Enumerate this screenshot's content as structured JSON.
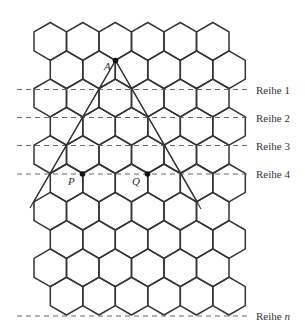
{
  "figure": {
    "grid": {
      "rows": 10,
      "hexes_per_row": 6,
      "orientation": "pointy-top",
      "origin_x": 34,
      "origin_top_y": 22.5,
      "hex_width": 32.5,
      "row_step": 28.3,
      "side": 18.9,
      "stroke": "#333333",
      "stroke_width": 1.5
    },
    "row_lines": [
      {
        "label": "Reihe ",
        "index": "1",
        "italic_index": false,
        "y": 89.5
      },
      {
        "label": "Reihe ",
        "index": "2",
        "italic_index": false,
        "y": 117.5
      },
      {
        "label": "Reihe ",
        "index": "3",
        "italic_index": false,
        "y": 145.5
      },
      {
        "label": "Reihe ",
        "index": "4",
        "italic_index": false,
        "y": 174
      },
      {
        "label": "Reihe ",
        "index": "n",
        "italic_index": true,
        "y": 316
      }
    ],
    "dash_x_start": 17,
    "dash_x_end": 249,
    "label_x": 256,
    "points": [
      {
        "name": "A",
        "x": 115.5,
        "y": 60.5,
        "label_x": 104,
        "label_y": 70
      },
      {
        "name": "P",
        "x": 82.5,
        "y": 174,
        "label_x": 68,
        "label_y": 185
      },
      {
        "name": "Q",
        "x": 147.5,
        "y": 174,
        "label_x": 132,
        "label_y": 185
      }
    ],
    "rays": [
      {
        "from": [
          115.5,
          60.5
        ],
        "to": [
          33,
          203
        ]
      },
      {
        "from": [
          115.5,
          60.5
        ],
        "to": [
          30,
          208
        ]
      },
      {
        "from": [
          115.5,
          60.5
        ],
        "to": [
          198,
          203
        ]
      },
      {
        "from": [
          115.5,
          60.5
        ],
        "to": [
          201,
          209
        ]
      }
    ]
  }
}
